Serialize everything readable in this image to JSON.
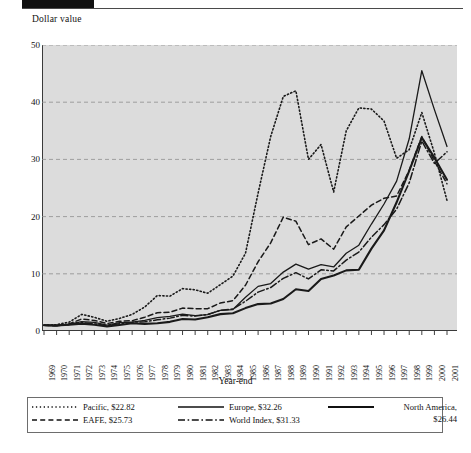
{
  "figure": {
    "y_axis_title": "Dollar value",
    "x_axis_title": "Year-end"
  },
  "chart_data": {
    "type": "line",
    "title": "",
    "subtitle": "",
    "xlabel": "Year-end",
    "ylabel": "Dollar value",
    "xlim": [
      1969,
      2001
    ],
    "ylim": [
      0,
      50
    ],
    "yticks": [
      0,
      10,
      20,
      30,
      40,
      50
    ],
    "grid": "horizontal-dashed",
    "legend_position": "bottom",
    "x": [
      1969,
      1970,
      1971,
      1972,
      1973,
      1974,
      1975,
      1976,
      1977,
      1978,
      1979,
      1980,
      1981,
      1982,
      1983,
      1984,
      1985,
      1986,
      1987,
      1988,
      1989,
      1990,
      1991,
      1992,
      1993,
      1994,
      1995,
      1996,
      1997,
      1998,
      1999,
      2000,
      2001
    ],
    "xticklabels": [
      "1969",
      "1970",
      "1971",
      "1972",
      "1973",
      "1974",
      "1975",
      "1976",
      "1977",
      "1978",
      "1979",
      "1980",
      "1981",
      "1982",
      "1983",
      "1984",
      "1985",
      "1986",
      "1987",
      "1988",
      "1989",
      "1990",
      "1991",
      "1992",
      "1993",
      "1994",
      "1995",
      "1996",
      "1997",
      "1998",
      "1999",
      "2000",
      "2001"
    ],
    "series": [
      {
        "name": "Pacific",
        "legend_label": "Pacific, $22.82",
        "final_value": 22.82,
        "style": "dotted",
        "color": "#1a1a1a",
        "width": 1.6,
        "values": [
          1.0,
          1.1,
          1.55,
          2.9,
          2.4,
          1.7,
          2.2,
          2.9,
          4.2,
          6.2,
          6.1,
          7.4,
          7.2,
          6.6,
          8.1,
          9.6,
          13.6,
          24.1,
          34.0,
          41.0,
          42.0,
          30.0,
          32.6,
          24.3,
          35.0,
          39.0,
          38.8,
          36.7,
          30.2,
          31.7,
          38.2,
          31.1,
          22.82
        ]
      },
      {
        "name": "EAFE",
        "legend_label": "EAFE, $25.73",
        "final_value": 25.73,
        "style": "dashed",
        "color": "#1a1a1a",
        "width": 1.5,
        "values": [
          1.0,
          0.9,
          1.25,
          2.1,
          1.85,
          1.3,
          1.7,
          1.8,
          2.4,
          3.2,
          3.3,
          4.0,
          3.9,
          3.9,
          4.9,
          5.3,
          8.0,
          12.1,
          15.4,
          19.9,
          19.2,
          15.1,
          16.1,
          14.3,
          18.2,
          20.1,
          22.0,
          23.2,
          23.6,
          28.1,
          34.0,
          29.7,
          25.73
        ]
      },
      {
        "name": "Europe",
        "legend_label": "Europe, $32.26",
        "final_value": 32.26,
        "style": "solid",
        "color": "#1a1a1a",
        "width": 1.3,
        "values": [
          1.0,
          0.92,
          1.18,
          1.62,
          1.5,
          1.02,
          1.45,
          1.55,
          1.85,
          2.35,
          2.55,
          2.95,
          2.7,
          2.85,
          3.6,
          3.75,
          5.9,
          7.8,
          8.3,
          10.3,
          11.7,
          10.8,
          11.6,
          11.2,
          13.6,
          15.0,
          18.7,
          22.2,
          26.2,
          33.6,
          45.5,
          38.7,
          32.26
        ]
      },
      {
        "name": "World Index",
        "legend_label": "World Index, $31.33",
        "final_value": 31.33,
        "style": "dashdot",
        "color": "#1a1a1a",
        "width": 1.5,
        "values": [
          1.0,
          0.95,
          1.1,
          1.45,
          1.25,
          0.95,
          1.25,
          1.55,
          1.6,
          1.95,
          2.25,
          2.75,
          2.6,
          2.9,
          3.6,
          3.85,
          5.2,
          6.8,
          7.6,
          9.2,
          10.2,
          9.1,
          10.7,
          10.5,
          12.4,
          13.8,
          16.4,
          18.6,
          21.3,
          25.9,
          33.2,
          29.3,
          31.33
        ]
      },
      {
        "name": "North America",
        "legend_label": "North America, $26.44",
        "legend_label_line1": "North America,",
        "legend_label_line2": "$26.44",
        "final_value": 26.44,
        "style": "solid",
        "color": "#1a1a1a",
        "width": 2.1,
        "values": [
          1.0,
          0.98,
          1.08,
          1.28,
          1.1,
          0.8,
          1.05,
          1.35,
          1.25,
          1.35,
          1.6,
          2.1,
          2.0,
          2.4,
          2.95,
          3.1,
          4.0,
          4.7,
          4.8,
          5.6,
          7.3,
          7.0,
          9.1,
          9.7,
          10.6,
          10.7,
          14.4,
          17.6,
          22.5,
          28.0,
          33.8,
          30.3,
          26.44
        ]
      }
    ]
  },
  "legend": {
    "entries": [
      {
        "label": "Pacific, $22.82",
        "style": "dotted"
      },
      {
        "label": "EAFE, $25.73",
        "style": "dashed"
      },
      {
        "label": "Europe, $32.26",
        "style": "solid"
      },
      {
        "label": "World Index, $31.33",
        "style": "dashdot"
      },
      {
        "label": "North America,",
        "label2": "$26.44",
        "style": "solid-thick"
      }
    ]
  }
}
